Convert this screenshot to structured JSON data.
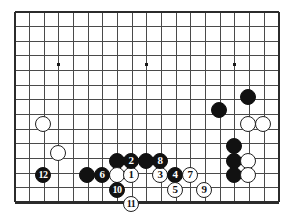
{
  "app": {
    "title": "Go board diagram",
    "kind": "go-game-record"
  },
  "board": {
    "style_name": "go-board-grid",
    "line_color": "#4a4a4a",
    "border_color": "#2b2b2b",
    "background_color": "#ffffff",
    "columns": 19,
    "rows": 14,
    "origin_x": 15,
    "origin_y": 12,
    "spacing": 14.65,
    "cols_drawn": 18,
    "rows_drawn": 13,
    "star_points": [
      {
        "x": 58,
        "y": 64
      },
      {
        "x": 146,
        "y": 64
      },
      {
        "x": 234,
        "y": 64
      }
    ]
  },
  "stones": [
    {
      "id": "w-upper-left-1",
      "color": "white",
      "label": "",
      "x": 43,
      "y": 124
    },
    {
      "id": "w-upper-left-2",
      "color": "white",
      "label": "",
      "x": 58,
      "y": 153
    },
    {
      "id": "b-right-1",
      "color": "black",
      "label": "",
      "x": 248,
      "y": 97
    },
    {
      "id": "b-right-2",
      "color": "black",
      "label": "",
      "x": 219,
      "y": 110
    },
    {
      "id": "w-right-1",
      "color": "white",
      "label": "",
      "x": 248,
      "y": 124
    },
    {
      "id": "w-right-2",
      "color": "white",
      "label": "",
      "x": 263,
      "y": 124
    },
    {
      "id": "b-right-3",
      "color": "black",
      "label": "",
      "x": 234,
      "y": 146
    },
    {
      "id": "b-right-4",
      "color": "black",
      "label": "",
      "x": 234,
      "y": 161
    },
    {
      "id": "b-right-5",
      "color": "black",
      "label": "",
      "x": 234,
      "y": 175
    },
    {
      "id": "w-right-3",
      "color": "white",
      "label": "",
      "x": 248,
      "y": 161
    },
    {
      "id": "w-right-4",
      "color": "white",
      "label": "",
      "x": 248,
      "y": 175
    },
    {
      "id": "b-bottom-left-1",
      "color": "black",
      "label": "",
      "x": 87,
      "y": 175
    },
    {
      "id": "b-center-top-1",
      "color": "black",
      "label": "",
      "x": 117,
      "y": 161
    },
    {
      "id": "b-center-top-2",
      "color": "black",
      "label": "",
      "x": 146,
      "y": 161
    },
    {
      "id": "w-center-1",
      "color": "white",
      "label": "",
      "x": 117,
      "y": 175
    },
    {
      "id": "move-1",
      "color": "white",
      "label": "1",
      "x": 131,
      "y": 175
    },
    {
      "id": "move-2",
      "color": "black",
      "label": "2",
      "x": 131,
      "y": 161
    },
    {
      "id": "move-3",
      "color": "white",
      "label": "3",
      "x": 160,
      "y": 175
    },
    {
      "id": "move-4",
      "color": "black",
      "label": "4",
      "x": 175,
      "y": 175
    },
    {
      "id": "move-5",
      "color": "white",
      "label": "5",
      "x": 175,
      "y": 190
    },
    {
      "id": "move-6",
      "color": "black",
      "label": "6",
      "x": 102,
      "y": 175
    },
    {
      "id": "move-7",
      "color": "white",
      "label": "7",
      "x": 190,
      "y": 175
    },
    {
      "id": "move-8",
      "color": "black",
      "label": "8",
      "x": 160,
      "y": 161
    },
    {
      "id": "move-9",
      "color": "white",
      "label": "9",
      "x": 204,
      "y": 190
    },
    {
      "id": "move-10",
      "color": "black",
      "label": "10",
      "x": 117,
      "y": 190
    },
    {
      "id": "move-11",
      "color": "white",
      "label": "11",
      "x": 131,
      "y": 204
    },
    {
      "id": "move-12",
      "color": "black",
      "label": "12",
      "x": 43,
      "y": 175
    }
  ],
  "stone_render": {
    "radius": 8.2,
    "font_size_single": 11,
    "font_size_double": 10
  }
}
